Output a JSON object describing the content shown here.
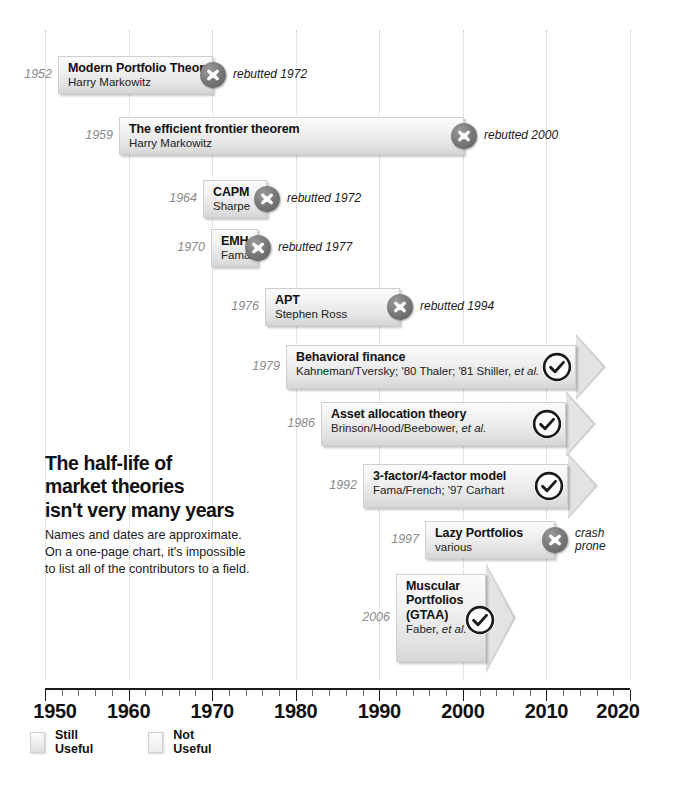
{
  "chart_data": {
    "type": "timeline",
    "note": "Names and dates are approximate.\nOn a one-page chart, it's impossible\nto list all of the contributors to a field.",
    "xlabel": "",
    "xlim": [
      1950,
      2020
    ],
    "axis_ticks": [
      1950,
      1960,
      1970,
      1980,
      1990,
      2000,
      2010,
      2020
    ],
    "minor_tick_step": 2,
    "grid": "dotted vertical at decades",
    "legend": [
      {
        "key": "useful",
        "label": "Still Useful"
      },
      {
        "key": "not",
        "label": "Not Useful"
      }
    ],
    "colors": {
      "box_fill_light": "#fbfbfb",
      "box_fill_dark": "#d6d6d6",
      "box_border": "#cfcfcf",
      "icon_x_fill": "#757575",
      "icon_check_stroke": "#1a1a1a",
      "year_text": "#8a8a8a",
      "gridline": "#c9c9c9",
      "axis": "#1a1a1a"
    },
    "entries": [
      {
        "year": "1952",
        "start": 1952,
        "end": 1972,
        "title": "Modern Portfolio Theory",
        "subtitle": "Harry Markowitz",
        "status": "not-useful",
        "status_icon": "x-circle-icon",
        "note": "rebutted 1972"
      },
      {
        "year": "1959",
        "start": 1959,
        "end": 2000,
        "title": "The efficient frontier theorem",
        "subtitle": "Harry Markowitz",
        "status": "not-useful",
        "status_icon": "x-circle-icon",
        "note": "rebutted 2000"
      },
      {
        "year": "1964",
        "start": 1964,
        "end": 1972,
        "title": "CAPM",
        "subtitle": "Sharpe",
        "status": "not-useful",
        "status_icon": "x-circle-icon",
        "note": "rebutted 1972"
      },
      {
        "year": "1970",
        "start": 1970,
        "end": 1977,
        "title": "EMH",
        "subtitle": "Fama",
        "status": "not-useful",
        "status_icon": "x-circle-icon",
        "note": "rebutted 1977"
      },
      {
        "year": "1976",
        "start": 1976,
        "end": 1994,
        "title": "APT",
        "subtitle": "Stephen Ross",
        "status": "not-useful",
        "status_icon": "x-circle-icon",
        "note": "rebutted 1994"
      },
      {
        "year": "1979",
        "start": 1979,
        "end": 2020,
        "title": "Behavioral finance",
        "subtitle": "Kahneman/Tversky; '80 Thaler; '81 Shiller, et al.",
        "status": "still-useful",
        "status_icon": "check-circle-icon",
        "note": ""
      },
      {
        "year": "1986",
        "start": 1986,
        "end": 2020,
        "title": "Asset allocation theory",
        "subtitle": "Brinson/Hood/Beebower, et al.",
        "status": "still-useful",
        "status_icon": "check-circle-icon",
        "note": ""
      },
      {
        "year": "1992",
        "start": 1992,
        "end": 2020,
        "title": "3-factor/4-factor model",
        "subtitle": "Fama/French; '97 Carhart",
        "status": "still-useful",
        "status_icon": "check-circle-icon",
        "note": ""
      },
      {
        "year": "1997",
        "start": 1997,
        "end": 2014,
        "title": "Lazy Portfolios",
        "subtitle": "various",
        "status": "not-useful",
        "status_icon": "x-circle-icon",
        "note": "crash\nprone"
      },
      {
        "year": "2006",
        "start": 2006,
        "end": 2020,
        "title": "Muscular\nPortfolios\n(GTAA)",
        "subtitle": "Faber, et al.",
        "status": "still-useful",
        "status_icon": "check-circle-icon",
        "note": ""
      }
    ]
  }
}
